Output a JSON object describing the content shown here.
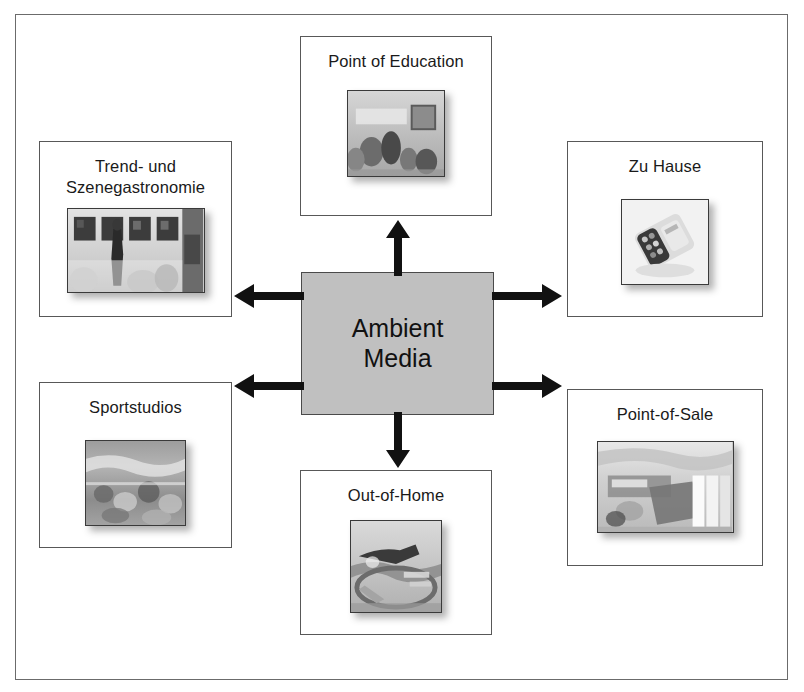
{
  "diagram": {
    "title_center": "Ambient\nMedia",
    "frame_color": "#6b6b6b",
    "center_fill": "#c0c0c0",
    "arrow_color": "#111111",
    "nodes": [
      {
        "id": "point-of-education",
        "label": "Point of Education",
        "position": "top",
        "thumb_alt": "classroom-photo"
      },
      {
        "id": "zu-hause",
        "label": "Zu Hause",
        "position": "top-right",
        "thumb_alt": "home-remote-photo"
      },
      {
        "id": "point-of-sale",
        "label": "Point-of-Sale",
        "position": "bottom-right",
        "thumb_alt": "retail-shelf-photo"
      },
      {
        "id": "out-of-home",
        "label": "Out-of-Home",
        "position": "bottom",
        "thumb_alt": "outdoor-street-photo"
      },
      {
        "id": "sportstudios",
        "label": "Sportstudios",
        "position": "bottom-left",
        "thumb_alt": "gym-photo"
      },
      {
        "id": "trend-und-szenegastronomie",
        "label": "Trend- und\nSzenegastronomie",
        "position": "top-left",
        "thumb_alt": "bar-lounge-photo"
      }
    ],
    "arrows": [
      {
        "id": "arrow-up",
        "direction": "up",
        "target": "point-of-education"
      },
      {
        "id": "arrow-down",
        "direction": "down",
        "target": "out-of-home"
      },
      {
        "id": "arrow-left-upper",
        "direction": "left",
        "target": "trend-und-szenegastronomie"
      },
      {
        "id": "arrow-left-lower",
        "direction": "left",
        "target": "sportstudios"
      },
      {
        "id": "arrow-right-upper",
        "direction": "right",
        "target": "zu-hause"
      },
      {
        "id": "arrow-right-lower",
        "direction": "right",
        "target": "point-of-sale"
      }
    ]
  }
}
